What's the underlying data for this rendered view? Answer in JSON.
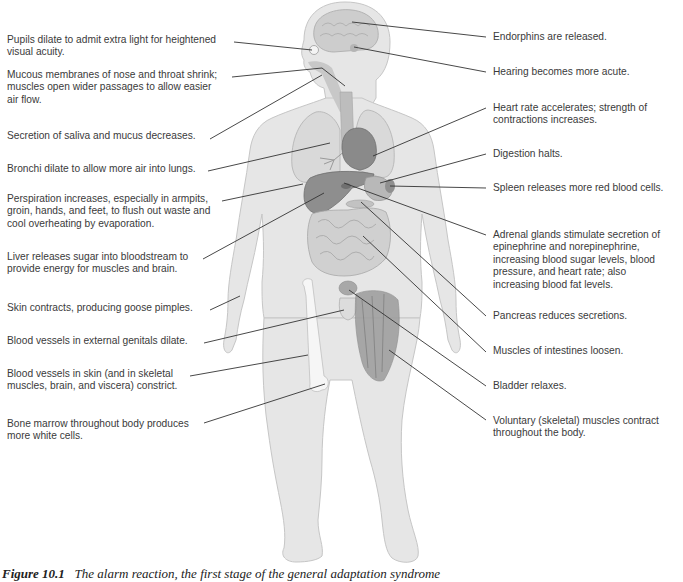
{
  "figure": {
    "caption_number": "Figure 10.1",
    "caption_text": "The alarm reaction, the first stage of the general adaptation syndrome",
    "colors": {
      "body": "#e4e4e4",
      "body_outline": "#c4c4c4",
      "organ": "#9a9a9a",
      "organ_dark": "#7c7c7c",
      "leader_line": "#333333"
    }
  },
  "left_labels": [
    {
      "id": "pupils",
      "lines": [
        "Pupils dilate to admit extra light for heightened",
        "visual acuity."
      ]
    },
    {
      "id": "mucous",
      "lines": [
        "Mucous membranes of nose and throat shrink;",
        "muscles open wider passages to allow easier",
        "air flow."
      ]
    },
    {
      "id": "saliva",
      "lines": [
        "Secretion of saliva and mucus decreases."
      ]
    },
    {
      "id": "bronchi",
      "lines": [
        "Bronchi dilate to allow more air into lungs."
      ]
    },
    {
      "id": "perspiration",
      "lines": [
        "Perspiration increases, especially in armpits,",
        "groin, hands, and feet, to flush out waste and",
        "cool overheating by evaporation."
      ]
    },
    {
      "id": "liver",
      "lines": [
        "Liver releases sugar into bloodstream to",
        "provide energy for muscles and brain."
      ]
    },
    {
      "id": "skin",
      "lines": [
        "Skin contracts, producing goose pimples."
      ]
    },
    {
      "id": "genitals",
      "lines": [
        "Blood vessels in external genitals dilate."
      ]
    },
    {
      "id": "vessels",
      "lines": [
        "Blood vessels in skin (and in skeletal",
        "muscles, brain, and viscera) constrict."
      ]
    },
    {
      "id": "marrow",
      "lines": [
        "Bone marrow throughout body produces",
        "more white cells."
      ]
    }
  ],
  "right_labels": [
    {
      "id": "endorphins",
      "lines": [
        "Endorphins are released."
      ]
    },
    {
      "id": "hearing",
      "lines": [
        "Hearing becomes more acute."
      ]
    },
    {
      "id": "heart",
      "lines": [
        "Heart rate accelerates; strength of",
        "contractions increases."
      ]
    },
    {
      "id": "digestion",
      "lines": [
        "Digestion halts."
      ]
    },
    {
      "id": "spleen",
      "lines": [
        "Spleen releases more red blood cells."
      ]
    },
    {
      "id": "adrenal",
      "lines": [
        "Adrenal glands stimulate secretion of",
        "epinephrine and norepinephrine,",
        "increasing blood sugar levels, blood",
        "pressure, and heart rate; also",
        "increasing blood fat levels."
      ]
    },
    {
      "id": "pancreas",
      "lines": [
        "Pancreas reduces secretions."
      ]
    },
    {
      "id": "intestines",
      "lines": [
        "Muscles of intestines loosen."
      ]
    },
    {
      "id": "bladder",
      "lines": [
        "Bladder relaxes."
      ]
    },
    {
      "id": "voluntary",
      "lines": [
        "Voluntary (skeletal) muscles contract",
        "throughout the body."
      ]
    }
  ]
}
